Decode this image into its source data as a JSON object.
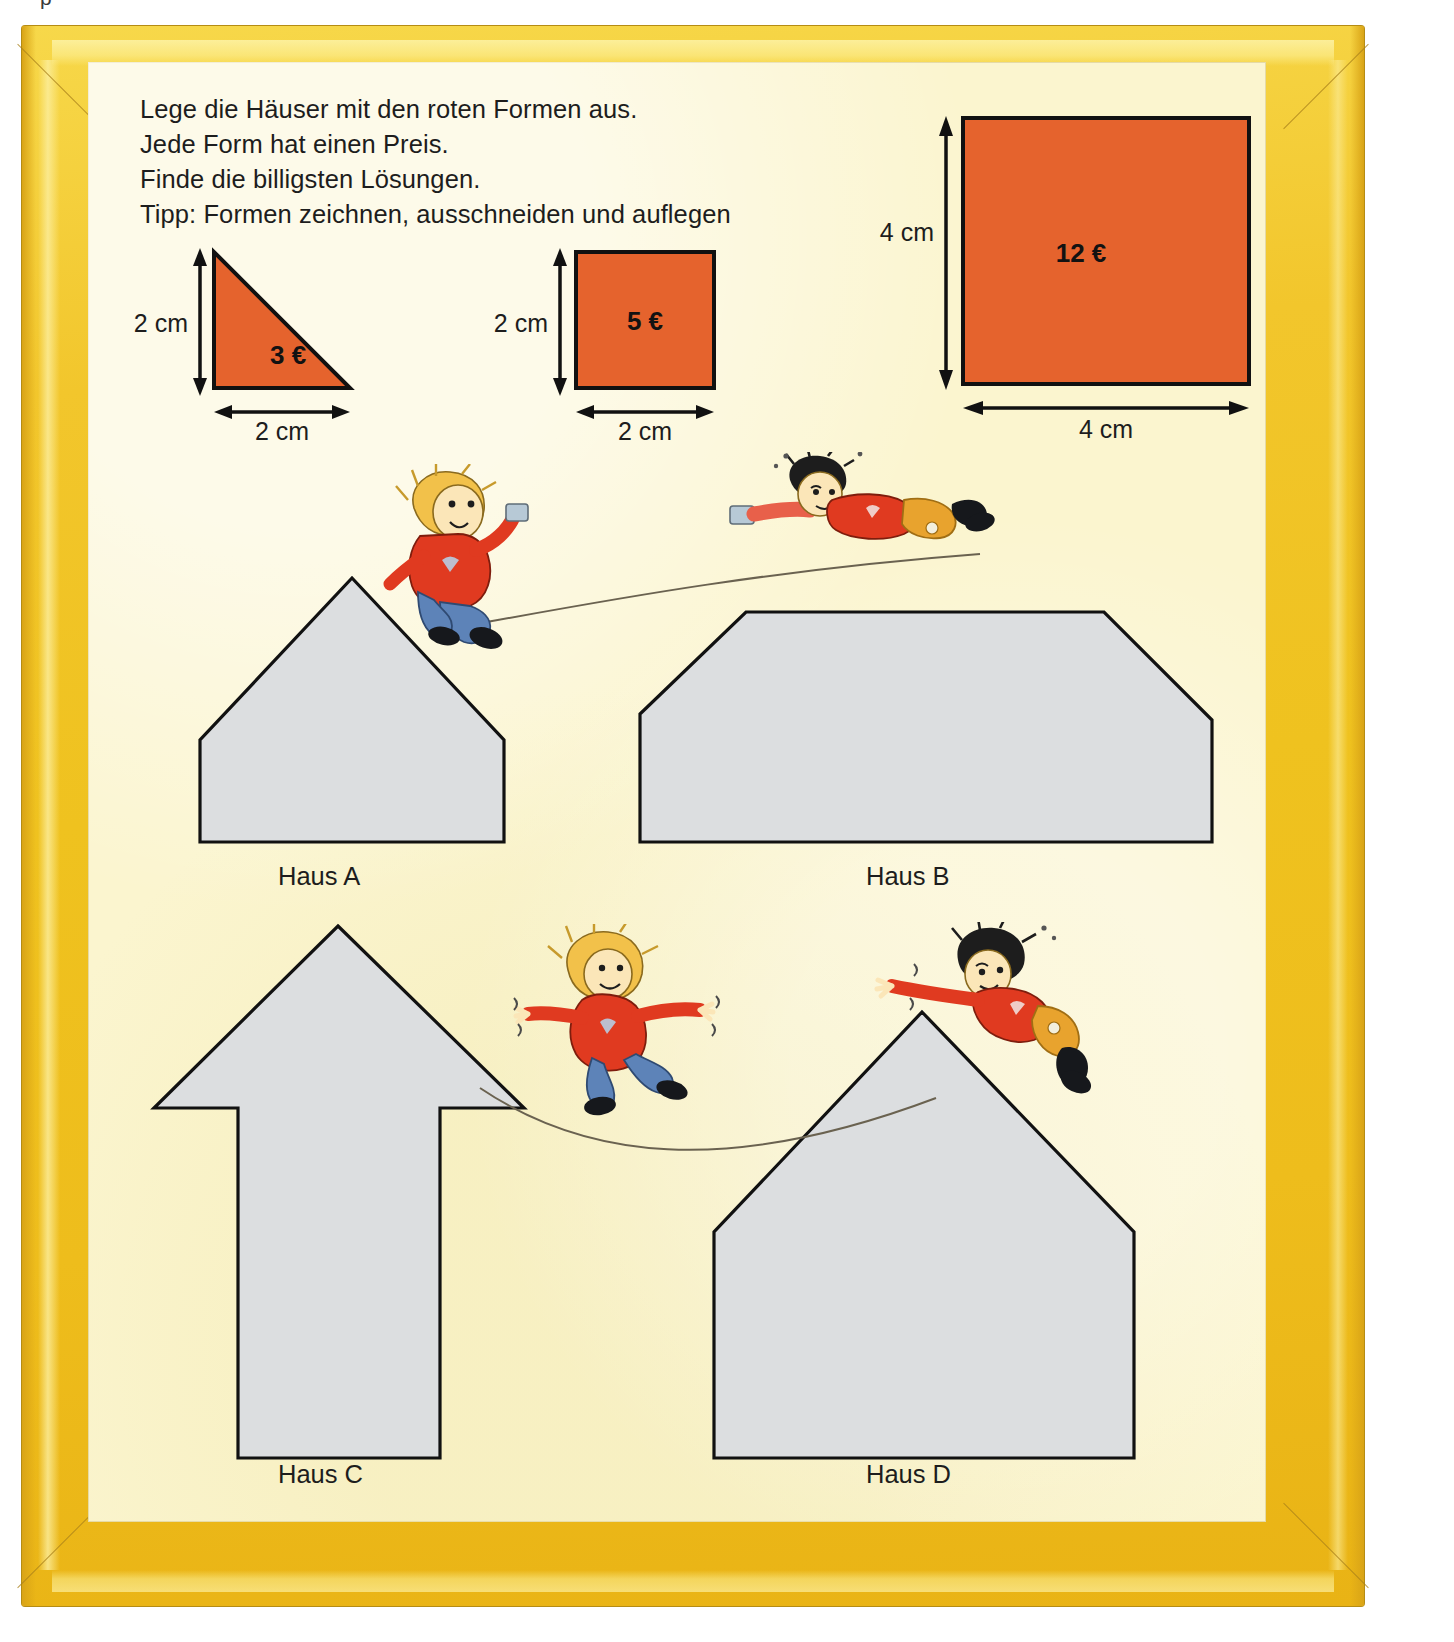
{
  "page": {
    "partial_top_text": "p",
    "background_color": "#fbf5cf",
    "frame_color": "#efc21f",
    "shape_fill_color": "#e5632d",
    "house_fill_color": "#dcdee0"
  },
  "instructions": {
    "lines": [
      "Lege die Häuser mit den roten Formen aus.",
      "Jede Form hat einen Preis.",
      "Finde die billigsten Lösungen.",
      "Tipp: Formen zeichnen, ausschneiden und auflegen"
    ]
  },
  "shapes": [
    {
      "id": "triangle",
      "kind": "right-triangle",
      "price": "3 €",
      "height_label": "2 cm",
      "width_label": "2 cm"
    },
    {
      "id": "small-square",
      "kind": "square",
      "price": "5 €",
      "height_label": "2 cm",
      "width_label": "2 cm"
    },
    {
      "id": "large-square",
      "kind": "square",
      "price": "12 €",
      "height_label": "4 cm",
      "width_label": "4 cm"
    }
  ],
  "houses": [
    {
      "id": "haus-a",
      "label": "Haus A",
      "shape": "pentagon-house"
    },
    {
      "id": "haus-b",
      "label": "Haus B",
      "shape": "hexagon-flat-top"
    },
    {
      "id": "haus-c",
      "label": "Haus C",
      "shape": "arrow-house"
    },
    {
      "id": "haus-d",
      "label": "Haus D",
      "shape": "pentagon-tall-roof"
    }
  ],
  "illustrations": [
    {
      "id": "kid-a",
      "description": "girl with tin-can phone sitting on roof of Haus A"
    },
    {
      "id": "kid-b",
      "description": "boy lying on flat roof of Haus B holding tin-can phone"
    },
    {
      "id": "kid-c",
      "description": "girl balancing on string rope between Haus C and Haus D"
    },
    {
      "id": "kid-d",
      "description": "boy leaning off roof of Haus D reaching toward the rope"
    }
  ]
}
